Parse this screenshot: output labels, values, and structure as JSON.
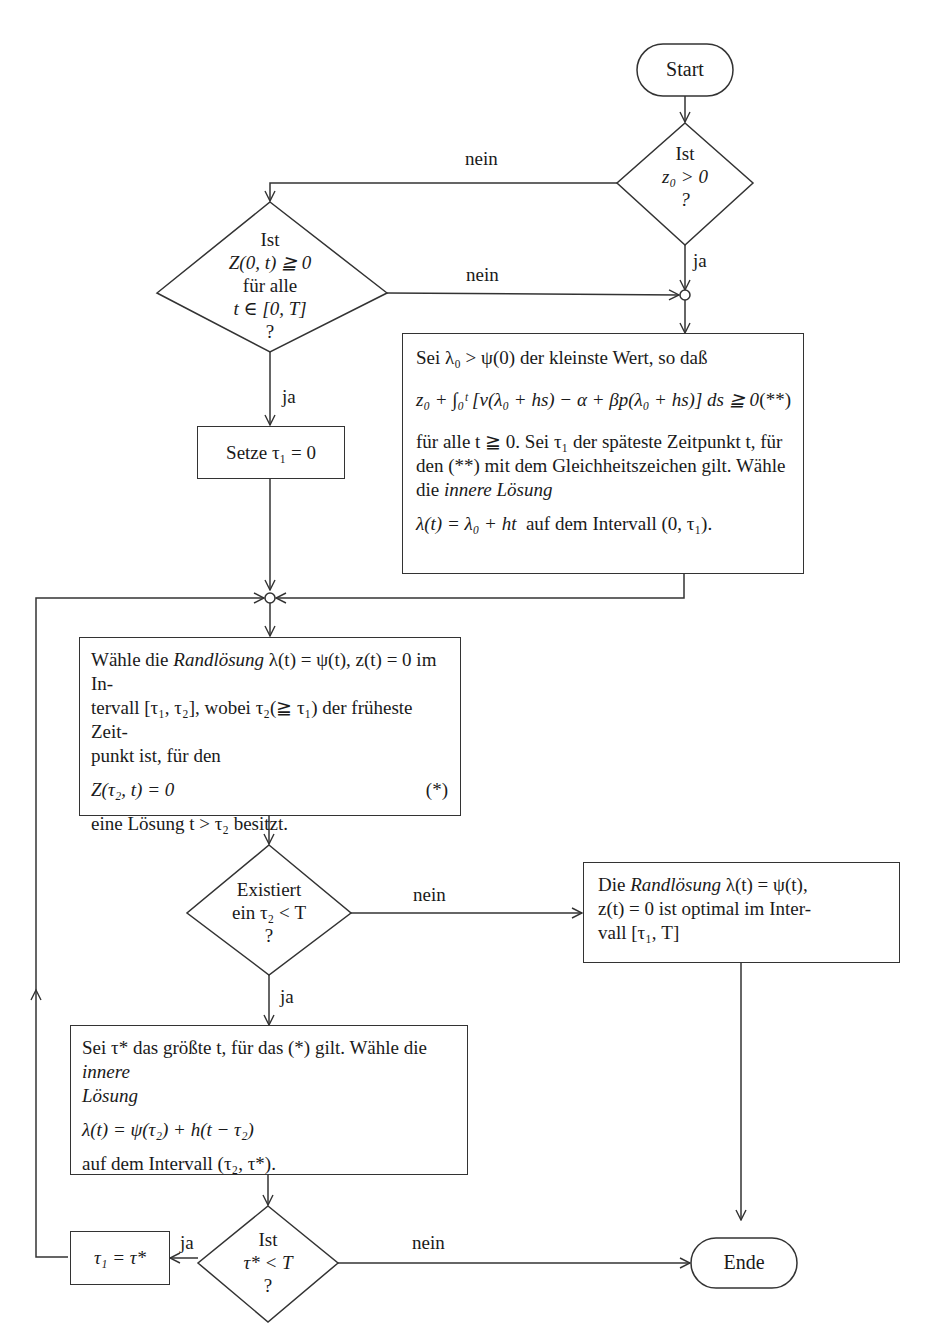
{
  "diagram": {
    "type": "flowchart",
    "language": "de",
    "colors": {
      "stroke": "#333333",
      "text": "#1a1a1a",
      "background": "#ffffff"
    }
  },
  "terminals": {
    "start": "Start",
    "end": "Ende"
  },
  "decisions": {
    "z0_positive": {
      "line1": "Ist",
      "line2": "z₀ > 0",
      "line3": "?"
    },
    "Z_nonneg": {
      "line1": "Ist",
      "line2": "Z(0, t) ≧ 0",
      "line3": "für alle",
      "line4": "t ∈ [0, T]",
      "line5": "?"
    },
    "exists_tau2": {
      "line1": "Existiert",
      "line2": "ein τ₂ < T",
      "line3": "?"
    },
    "tau_star_lt_T": {
      "line1": "Ist",
      "line2": "τ* < T",
      "line3": "?"
    }
  },
  "processes": {
    "set_tau1": "Setze τ₁ = 0",
    "inner_solution_1": {
      "line1": "Sei λ₀ > ψ(0) der kleinste Wert, so daß",
      "formula": "z₀ + ∫₀ᵗ [v(λ₀ + hs) − α + βp(λ₀ + hs)] ds ≧ 0",
      "formula_tag": "(**)",
      "line3": "für alle t ≧ 0. Sei τ₁ der späteste Zeitpunkt t, für",
      "line4": "den (**) mit dem Gleichheitszeichen gilt. Wähle",
      "line5_prefix": "die ",
      "line5_italic": "innere Lösung",
      "line6_formula": "λ(t) = λ₀ + ht",
      "line6_suffix": "  auf dem Intervall (0, τ₁)."
    },
    "boundary_solution": {
      "line1_prefix": "Wähle die ",
      "line1_italic": "Randlösung",
      "line1_suffix": " λ(t) = ψ(t), z(t) = 0 im In-",
      "line2": "tervall [τ₁, τ₂], wobei τ₂(≧ τ₁) der früheste Zeit-",
      "line3": "punkt ist, für den",
      "formula": "Z(τ₂, t) = 0",
      "formula_tag": "(*)",
      "line5": "eine Lösung t > τ₂ besitzt."
    },
    "boundary_optimal": {
      "line1_prefix": "Die ",
      "line1_italic": "Randlösung",
      "line1_suffix": " λ(t) = ψ(t),",
      "line2": "z(t) = 0 ist optimal im Inter-",
      "line3": "vall [τ₁, T]"
    },
    "inner_solution_2": {
      "line1_prefix": "Sei τ* das größte t, für das (*) gilt. Wähle die ",
      "line1_italic": "innere",
      "line2_italic": "Lösung",
      "formula": "λ(t) = ψ(τ₂) + h(t − τ₂)",
      "line4": "auf dem Intervall (τ₂, τ*)."
    },
    "set_tau1_star": "τ₁ = τ*"
  },
  "edge_labels": {
    "z0_no": "nein",
    "z0_yes": "ja",
    "Z_no": "nein",
    "Z_yes": "ja",
    "exists_no": "nein",
    "exists_yes": "ja",
    "tau_yes": "ja",
    "tau_no": "nein"
  }
}
